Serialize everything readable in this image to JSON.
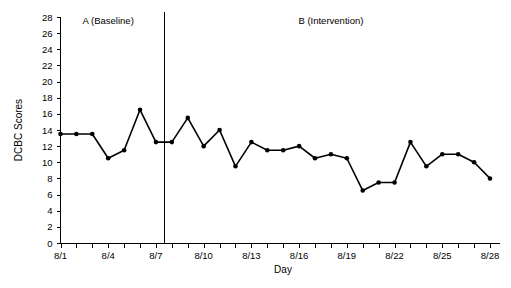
{
  "chart_data": {
    "type": "line",
    "title": "",
    "xlabel": "Day",
    "ylabel": "DCBC Scores",
    "ylim": [
      0,
      28
    ],
    "ytick_step": 2,
    "yticks": [
      0,
      2,
      4,
      6,
      8,
      10,
      12,
      14,
      16,
      18,
      20,
      22,
      24,
      26,
      28
    ],
    "ytick_labels": [
      "0",
      "2",
      "4",
      "6",
      "8",
      "10",
      "12",
      "14",
      "16",
      "18",
      "20",
      "22",
      "24",
      "26",
      "28"
    ],
    "grid": false,
    "legend": "none",
    "x": [
      "8/1",
      "8/2",
      "8/3",
      "8/4",
      "8/5",
      "8/6",
      "8/7",
      "8/8",
      "8/9",
      "8/10",
      "8/11",
      "8/12",
      "8/13",
      "8/14",
      "8/15",
      "8/16",
      "8/17",
      "8/18",
      "8/19",
      "8/20",
      "8/21",
      "8/22",
      "8/23",
      "8/24",
      "8/25",
      "8/26",
      "8/27",
      "8/28"
    ],
    "xtick_labels": [
      "8/1",
      "",
      "",
      "8/4",
      "",
      "",
      "8/7",
      "",
      "",
      "8/10",
      "",
      "",
      "8/13",
      "",
      "",
      "8/16",
      "",
      "",
      "8/19",
      "",
      "",
      "8/22",
      "",
      "",
      "8/25",
      "",
      "",
      "8/28"
    ],
    "values": [
      13.5,
      13.5,
      13.5,
      10.5,
      11.5,
      16.5,
      12.5,
      12.5,
      15.5,
      12.0,
      14.0,
      9.5,
      12.5,
      11.5,
      11.5,
      12.0,
      10.5,
      11.0,
      10.5,
      6.5,
      7.5,
      7.5,
      12.5,
      9.5,
      11.0,
      11.0,
      10.0,
      8.0
    ],
    "series_color": "#000000",
    "marker": "circle",
    "annotations": [
      {
        "name": "phase-a-label",
        "text": "A (Baseline)",
        "x_index_start": 0,
        "x_index_end": 6
      },
      {
        "name": "phase-b-label",
        "text": "B (Intervention)",
        "x_index_start": 7,
        "x_index_end": 27
      }
    ],
    "phase_change_line": {
      "after_x": "8/7",
      "style": "solid-vertical"
    }
  },
  "axes": {
    "y_title": "DCBC Scores",
    "x_title": "Day"
  },
  "phases": {
    "a_label": "A (Baseline)",
    "b_label": "B (Intervention)"
  }
}
